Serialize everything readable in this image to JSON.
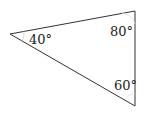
{
  "diagram": {
    "type": "triangle",
    "vertices": {
      "left": {
        "x": 10,
        "y": 34
      },
      "top_right": {
        "x": 135,
        "y": 11
      },
      "bottom_right": {
        "x": 135,
        "y": 106
      }
    },
    "angles": [
      {
        "vertex": "left",
        "label": "40°"
      },
      {
        "vertex": "top_right",
        "label": "80°"
      },
      {
        "vertex": "bottom_right",
        "label": "60°"
      }
    ],
    "stroke_color": "#333333",
    "arc_color": "#cfcfcf"
  }
}
